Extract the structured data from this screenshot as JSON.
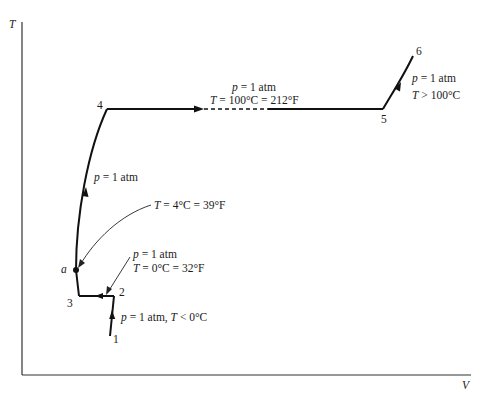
{
  "diagram": {
    "type": "T-V phase diagram of water heated at constant pressure",
    "axes": {
      "y_label": "T",
      "x_label": "V"
    },
    "points": {
      "p1": "1",
      "p2": "2",
      "p3": "3",
      "pa": "a",
      "p4": "4",
      "p5": "5",
      "p6": "6"
    },
    "annotations": {
      "seg_1_2": {
        "p": "p",
        "rest": " = 1 atm, ",
        "T": "T",
        "cond": " < 0°C"
      },
      "point_2": {
        "line1_p": "p",
        "line1_rest": " = 1 atm",
        "line2_T": "T",
        "line2_rest": " = 0°C = 32°F"
      },
      "point_a": {
        "T": "T",
        "rest": " = 4°C = 39°F"
      },
      "seg_a_4": {
        "p": "p",
        "rest": " = 1 atm"
      },
      "seg_4_5": {
        "line1_p": "p",
        "line1_rest": " = 1 atm",
        "line2_T": "T",
        "line2_rest": " = 100°C = 212°F"
      },
      "seg_5_6": {
        "line1_p": "p",
        "line1_rest": " = 1 atm",
        "line2_T": "T",
        "line2_rest": " > 100°C"
      }
    },
    "colors": {
      "line": "#111111",
      "axis": "#333333",
      "text": "#1a1a1a"
    }
  }
}
